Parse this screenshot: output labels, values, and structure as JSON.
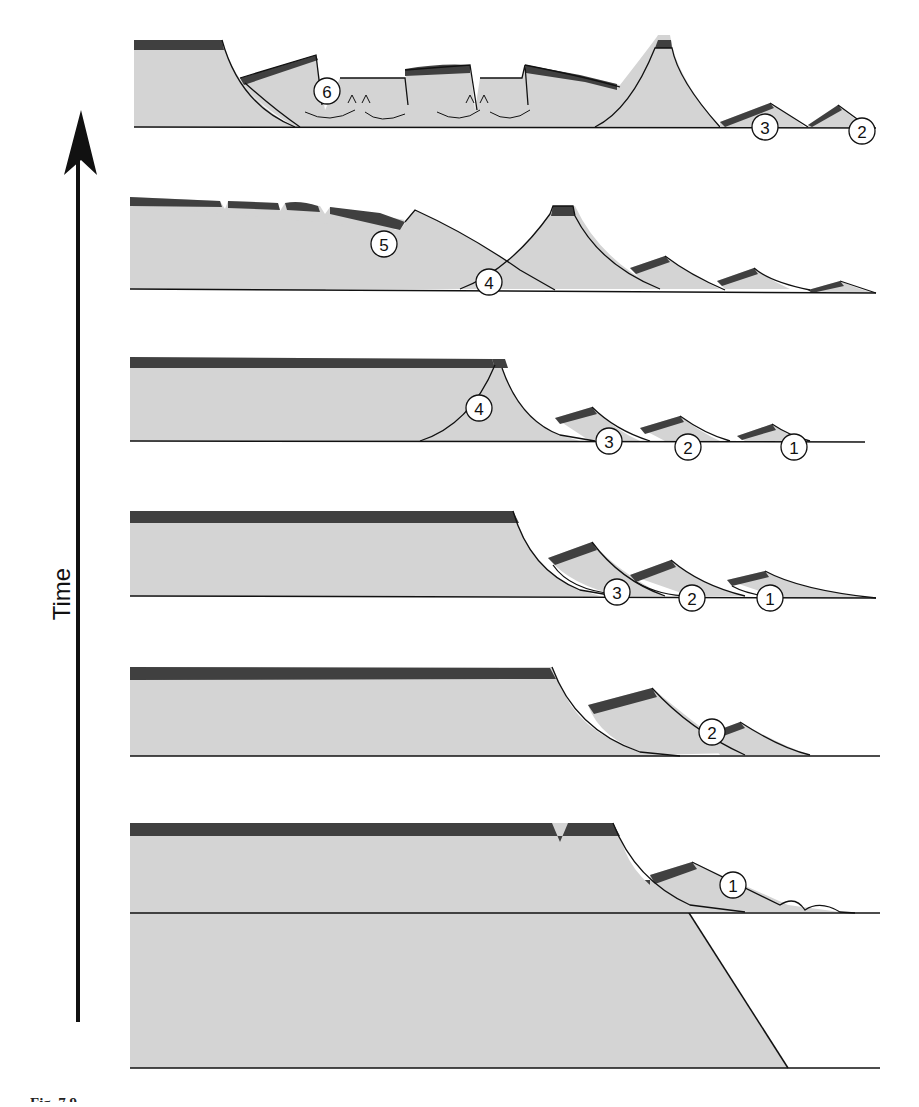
{
  "figure": {
    "axis_label": "Time",
    "caption_fragment": "Fig. 7.9",
    "colors": {
      "basement": "#d4d4d4",
      "cover": "#404040",
      "outline": "#111111",
      "background": "#ffffff"
    },
    "panels": [
      {
        "stage": 7,
        "position": "top",
        "labels": [
          "6",
          "3",
          "2"
        ]
      },
      {
        "stage": 6,
        "labels": [
          "5",
          "4"
        ]
      },
      {
        "stage": 5,
        "labels": [
          "4",
          "3",
          "2",
          "1"
        ]
      },
      {
        "stage": 4,
        "labels": [
          "3",
          "2",
          "1"
        ]
      },
      {
        "stage": 3,
        "labels": [
          "2"
        ]
      },
      {
        "stage": 2,
        "labels": [
          "1"
        ]
      },
      {
        "stage": 1,
        "position": "bottom",
        "labels": []
      }
    ]
  }
}
